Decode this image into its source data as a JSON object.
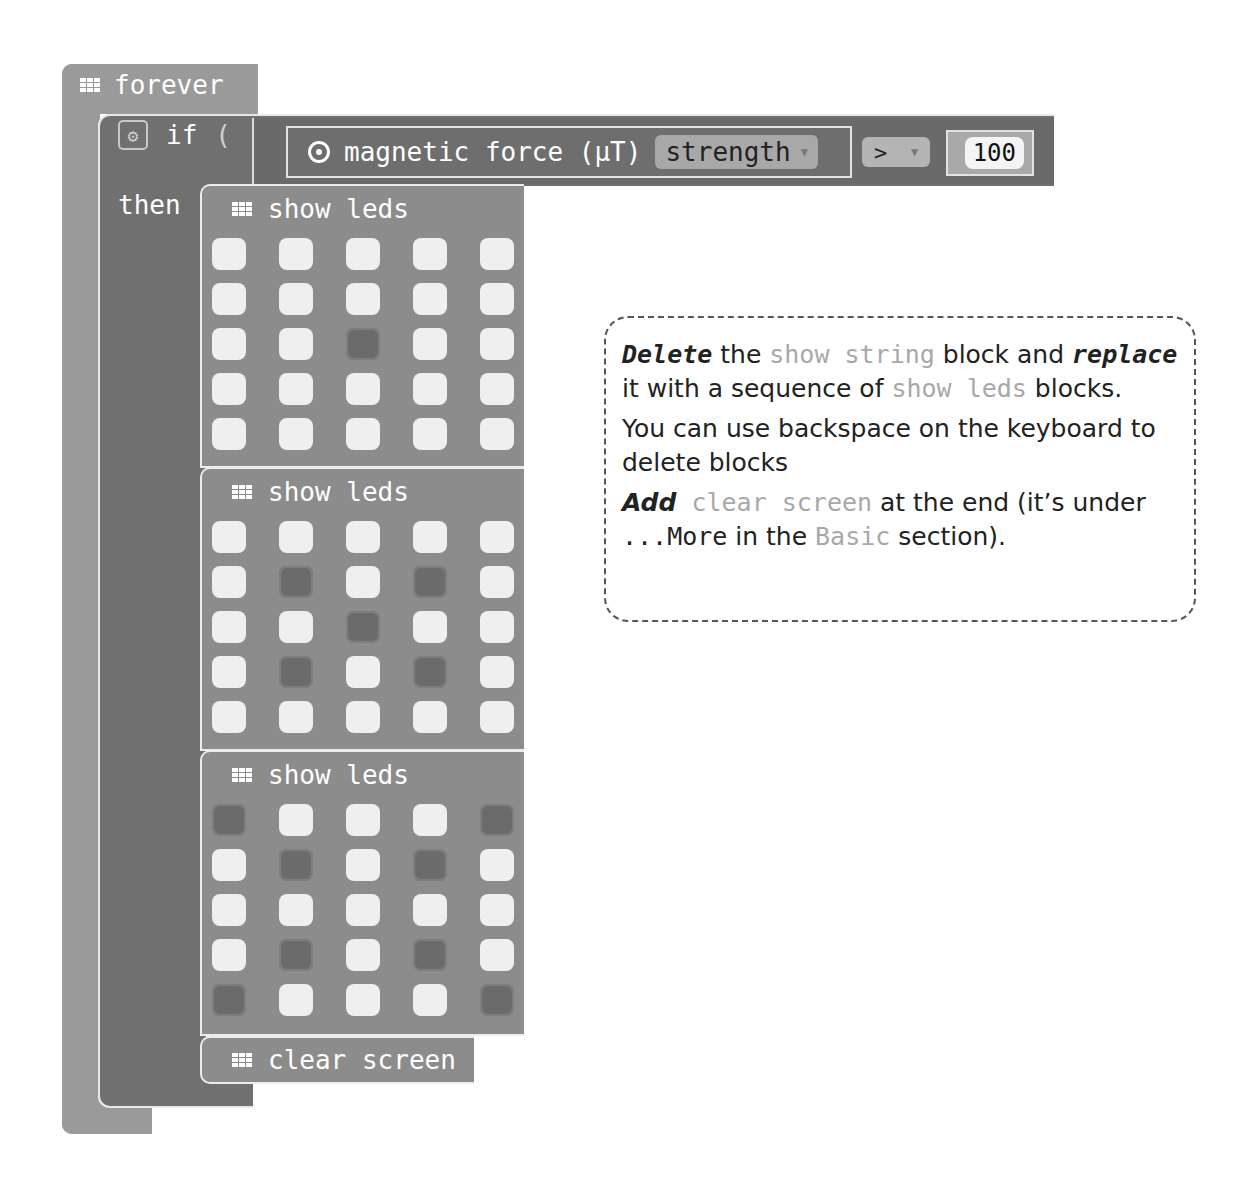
{
  "workspace": {
    "forever": {
      "label": "forever",
      "icon": "grid-icon"
    },
    "if_block": {
      "label": "if",
      "then_label": "then",
      "icon": "gear-icon",
      "condition": {
        "sensor_icon": "target-icon",
        "sensor_label": "magnetic force (µT)",
        "axis_value": "strength",
        "operator": ">",
        "compare_value": "100"
      }
    },
    "show_leds": [
      {
        "label": "show leds",
        "grid": [
          [
            1,
            1,
            1,
            1,
            1
          ],
          [
            1,
            1,
            1,
            1,
            1
          ],
          [
            1,
            1,
            0,
            1,
            1
          ],
          [
            1,
            1,
            1,
            1,
            1
          ],
          [
            1,
            1,
            1,
            1,
            1
          ]
        ]
      },
      {
        "label": "show leds",
        "grid": [
          [
            1,
            1,
            1,
            1,
            1
          ],
          [
            1,
            0,
            1,
            0,
            1
          ],
          [
            1,
            1,
            0,
            1,
            1
          ],
          [
            1,
            0,
            1,
            0,
            1
          ],
          [
            1,
            1,
            1,
            1,
            1
          ]
        ]
      },
      {
        "label": "show leds",
        "grid": [
          [
            0,
            1,
            1,
            1,
            0
          ],
          [
            1,
            0,
            1,
            0,
            1
          ],
          [
            1,
            1,
            1,
            1,
            1
          ],
          [
            1,
            0,
            1,
            0,
            1
          ],
          [
            0,
            1,
            1,
            1,
            0
          ]
        ]
      }
    ],
    "clear_screen": {
      "label": "clear screen"
    }
  },
  "note": {
    "p1": {
      "em1": "Delete",
      "t1": " the ",
      "code1": "show string",
      "t2": "  block and ",
      "em2": "replace",
      "t3": " it with a sequence of ",
      "code2": "show leds",
      "t4": " blocks."
    },
    "p2": "You can use backspace on the keyboard to delete blocks",
    "p3": {
      "em": "Add",
      "code1": " clear screen",
      "t1": " at the end (it’s under ",
      "mono": "...More",
      "t2": " in the ",
      "code2": "Basic",
      "t3": " section)."
    }
  },
  "colors": {
    "forever_block": "#9a9a9a",
    "if_block": "#707070",
    "led_block": "#8c8c8c",
    "led_on": "#efefef",
    "led_off": "#6b6b6b"
  }
}
